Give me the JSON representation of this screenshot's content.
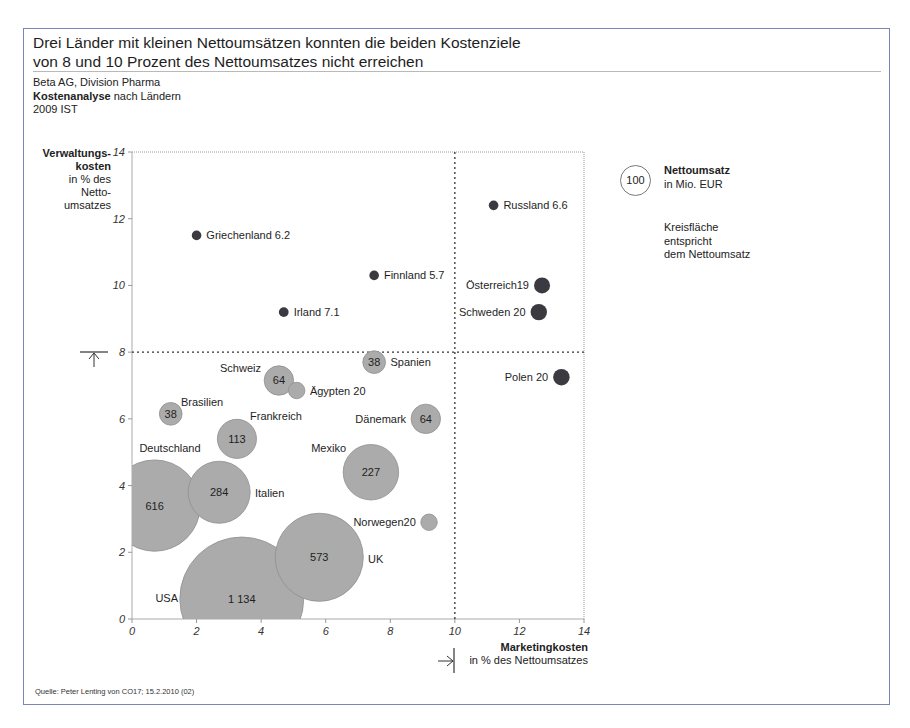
{
  "header": {
    "title_line1": "Drei Länder mit kleinen Nettoumsätzen konnten die beiden Kostenziele",
    "title_line2": "von 8 und 10 Prozent des Nettoumsatzes nicht erreichen",
    "company": "Beta AG, Division Pharma",
    "analysis_bold": "Kostenanalyse",
    "analysis_rest": " nach Ländern",
    "period": "2009 IST"
  },
  "legend": {
    "circle_value": "100",
    "title": "Nettoumsatz",
    "unit": "in Mio. EUR",
    "note_line1": "Kreisfläche",
    "note_line2": "entspricht",
    "note_line3": "dem Nettoumsatz"
  },
  "footer": {
    "source": "Quelle: Peter Lenting von CO17; 15.2.2010 (02)"
  },
  "colors": {
    "frame": "#7b86b8",
    "bubble_fill": "#ababab",
    "bubble_stroke": "#8f8f8f",
    "dot_fill": "#3a3a40",
    "target_line": "#333333"
  },
  "chart_data": {
    "type": "scatter",
    "subtype": "bubble",
    "title": "Drei Länder mit kleinen Nettoumsätzen konnten die beiden Kostenziele von 8 und 10 Prozent des Nettoumsatzes nicht erreichen",
    "xlabel": "Marketingkosten",
    "xlabel_sub": "in % des Nettoumsatzes",
    "ylabel": "Verwaltungs-kosten",
    "ylabel_sub": "in % des Netto-umsatzes",
    "xlim": [
      0,
      14
    ],
    "ylim": [
      0,
      14
    ],
    "xticks": [
      0,
      2,
      4,
      6,
      8,
      10,
      12,
      14
    ],
    "yticks": [
      0,
      2,
      4,
      6,
      8,
      10,
      12,
      14
    ],
    "grid": false,
    "reference_lines": {
      "x": 10,
      "y": 8,
      "style": "dotted"
    },
    "size_legend": "Nettoumsatz in Mio. EUR (Kreisfläche entspricht dem Nettoumsatz)",
    "points": [
      {
        "name": "Griechenland",
        "x": 2.0,
        "y": 11.5,
        "size": 6.2,
        "label": "Griechenland 6.2",
        "label_pos": "right",
        "style": "dot"
      },
      {
        "name": "Finnland",
        "x": 7.5,
        "y": 10.3,
        "size": 5.7,
        "label": "Finnland 5.7",
        "label_pos": "right",
        "style": "dot"
      },
      {
        "name": "Irland",
        "x": 4.7,
        "y": 9.2,
        "size": 7.1,
        "label": "Irland 7.1",
        "label_pos": "right",
        "style": "dot"
      },
      {
        "name": "Russland",
        "x": 11.2,
        "y": 12.4,
        "size": 6.6,
        "label": "Russland 6.6",
        "label_pos": "right",
        "style": "dot"
      },
      {
        "name": "Österreich",
        "x": 12.7,
        "y": 10.0,
        "size": 19,
        "label": "Österreich19",
        "label_pos": "left",
        "style": "dot"
      },
      {
        "name": "Schweden",
        "x": 12.6,
        "y": 9.2,
        "size": 20,
        "label": "Schweden 20",
        "label_pos": "left",
        "style": "dot"
      },
      {
        "name": "Polen",
        "x": 13.3,
        "y": 7.25,
        "size": 20,
        "label": "Polen 20",
        "label_pos": "left",
        "style": "dot"
      },
      {
        "name": "Spanien",
        "x": 7.5,
        "y": 7.7,
        "size": 38,
        "label": "Spanien",
        "inner": "38",
        "label_pos": "right",
        "style": "bubble"
      },
      {
        "name": "Schweiz",
        "x": 4.55,
        "y": 7.15,
        "size": 64,
        "label": "Schweiz",
        "inner": "64",
        "label_pos": "left-top",
        "style": "bubble"
      },
      {
        "name": "Ägypten",
        "x": 5.1,
        "y": 6.85,
        "size": 20,
        "label": "Ägypten 20",
        "label_pos": "right",
        "style": "bubble"
      },
      {
        "name": "Brasilien",
        "x": 1.2,
        "y": 6.15,
        "size": 38,
        "label": "Brasilien",
        "inner": "38",
        "label_pos": "right-top",
        "style": "bubble"
      },
      {
        "name": "Dänemark",
        "x": 9.1,
        "y": 6.0,
        "size": 64,
        "label": "Dänemark",
        "inner": "64",
        "label_pos": "left",
        "style": "bubble"
      },
      {
        "name": "Frankreich",
        "x": 3.25,
        "y": 5.4,
        "size": 113,
        "label": "Frankreich",
        "inner": "113",
        "label_pos": "right-top",
        "style": "bubble"
      },
      {
        "name": "Mexiko",
        "x": 7.4,
        "y": 4.4,
        "size": 227,
        "label": "Mexiko",
        "inner": "227",
        "label_pos": "left-top",
        "style": "bubble"
      },
      {
        "name": "Deutschland",
        "x": 0.7,
        "y": 3.4,
        "size": 616,
        "label": "Deutschland",
        "inner": "616",
        "label_pos": "top",
        "style": "bubble"
      },
      {
        "name": "Italien",
        "x": 2.7,
        "y": 3.8,
        "size": 284,
        "label": "Italien",
        "inner": "284",
        "label_pos": "right",
        "style": "bubble"
      },
      {
        "name": "Norwegen",
        "x": 9.2,
        "y": 2.9,
        "size": 20,
        "label": "Norwegen20",
        "label_pos": "left",
        "style": "bubble"
      },
      {
        "name": "UK",
        "x": 5.8,
        "y": 1.85,
        "size": 573,
        "label": "UK",
        "inner": "573",
        "label_pos": "right",
        "style": "bubble"
      },
      {
        "name": "USA",
        "x": 3.4,
        "y": 0.6,
        "size": 1134,
        "label": "USA",
        "inner": "1 134",
        "label_pos": "left",
        "style": "bubble"
      }
    ]
  }
}
